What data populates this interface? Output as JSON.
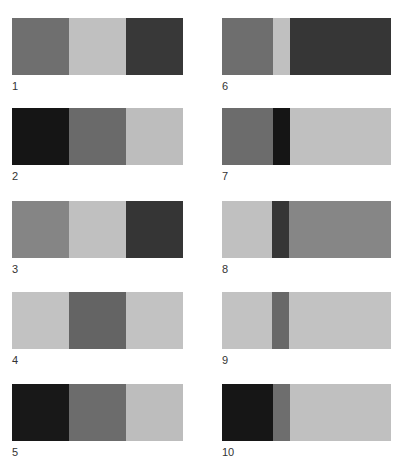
{
  "colors": {
    "black": "#161616",
    "dark": "#363636",
    "mid": "#6e6e6e",
    "mid2": "#7c7c7c",
    "light": "#bdbdbd",
    "light2": "#c4c4c4"
  },
  "panels": [
    {
      "label": "1",
      "x": 12,
      "y": 18,
      "segments": [
        {
          "w": 57,
          "c": "#6f6f6f"
        },
        {
          "w": 57,
          "c": "#c0c0c0"
        },
        {
          "w": 57,
          "c": "#383838"
        }
      ]
    },
    {
      "label": "2",
      "x": 12,
      "y": 108,
      "segments": [
        {
          "w": 57,
          "c": "#151515"
        },
        {
          "w": 57,
          "c": "#6a6a6a"
        },
        {
          "w": 57,
          "c": "#bdbdbd"
        }
      ]
    },
    {
      "label": "3",
      "x": 12,
      "y": 201,
      "segments": [
        {
          "w": 57,
          "c": "#858585"
        },
        {
          "w": 57,
          "c": "#c0c0c0"
        },
        {
          "w": 57,
          "c": "#353535"
        }
      ]
    },
    {
      "label": "4",
      "x": 12,
      "y": 292,
      "segments": [
        {
          "w": 57,
          "c": "#c2c2c2"
        },
        {
          "w": 57,
          "c": "#646464"
        },
        {
          "w": 57,
          "c": "#c2c2c2"
        }
      ]
    },
    {
      "label": "5",
      "x": 12,
      "y": 384,
      "segments": [
        {
          "w": 57,
          "c": "#181818"
        },
        {
          "w": 57,
          "c": "#6c6c6c"
        },
        {
          "w": 57,
          "c": "#bdbdbd"
        }
      ]
    },
    {
      "label": "6",
      "x": 222,
      "y": 18,
      "segments": [
        {
          "w": 51,
          "c": "#6e6e6e"
        },
        {
          "w": 17,
          "c": "#c0c0c0"
        },
        {
          "w": 101,
          "c": "#363636"
        }
      ]
    },
    {
      "label": "7",
      "x": 222,
      "y": 108,
      "segments": [
        {
          "w": 51,
          "c": "#6c6c6c"
        },
        {
          "w": 17,
          "c": "#151515"
        },
        {
          "w": 101,
          "c": "#c0c0c0"
        }
      ]
    },
    {
      "label": "8",
      "x": 222,
      "y": 201,
      "segments": [
        {
          "w": 50,
          "c": "#c0c0c0"
        },
        {
          "w": 17,
          "c": "#363636"
        },
        {
          "w": 102,
          "c": "#868686"
        }
      ]
    },
    {
      "label": "9",
      "x": 222,
      "y": 292,
      "segments": [
        {
          "w": 50,
          "c": "#c2c2c2"
        },
        {
          "w": 17,
          "c": "#686868"
        },
        {
          "w": 102,
          "c": "#c2c2c2"
        }
      ]
    },
    {
      "label": "10",
      "x": 222,
      "y": 384,
      "segments": [
        {
          "w": 51,
          "c": "#161616"
        },
        {
          "w": 17,
          "c": "#6e6e6e"
        },
        {
          "w": 101,
          "c": "#c0c0c0"
        }
      ]
    }
  ]
}
